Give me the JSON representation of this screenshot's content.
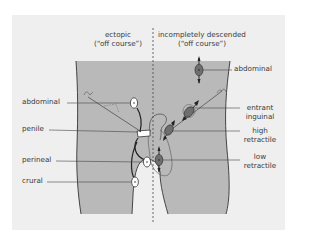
{
  "figure": {
    "colors": {
      "panel_background": "#efefef",
      "body_fill": "#b9b9b9",
      "outline": "#333333",
      "ectopic_testis_fill": "#ffffff",
      "undescended_testis_fill": "#6e6e6e",
      "leader_line": "#444444"
    },
    "headers": {
      "left": {
        "line1": "ectopic",
        "line2": "(“off course”)"
      },
      "right": {
        "line1": "incompletely descended",
        "line2": "(“off course”)"
      }
    },
    "left_labels": [
      {
        "id": "abdominal",
        "text": "abdominal"
      },
      {
        "id": "penile",
        "text": "penile"
      },
      {
        "id": "perineal",
        "text": "perineal"
      },
      {
        "id": "crural",
        "text": "crural"
      }
    ],
    "right_labels": [
      {
        "id": "abdominal",
        "text": "abdominal"
      },
      {
        "id": "entrant-inguinal",
        "line1": "entrant",
        "line2": "inguinal"
      },
      {
        "id": "high-retractile",
        "line1": "high",
        "line2": "retractile"
      },
      {
        "id": "low-retractile",
        "line1": "low",
        "line2": "retractile"
      }
    ],
    "divider": "dashed midline"
  }
}
